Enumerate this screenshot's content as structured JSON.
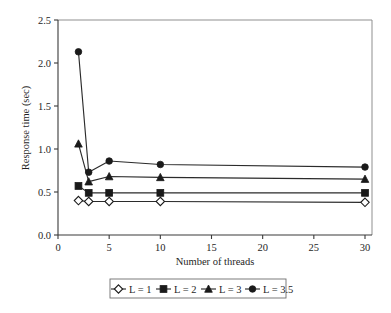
{
  "chart_data": {
    "type": "line",
    "title": "",
    "xlabel": "Number of threads",
    "ylabel": "Response time (sec)",
    "xlim": [
      0,
      30
    ],
    "ylim": [
      0,
      2.5
    ],
    "xticks": [
      "0",
      "5",
      "10",
      "15",
      "20",
      "25",
      "30"
    ],
    "yticks": [
      "0.0",
      "0.5",
      "1.0",
      "1.5",
      "2.0",
      "2.5"
    ],
    "grid": false,
    "legend_position": "below-bottom-center",
    "x": [
      2,
      3,
      5,
      10,
      30
    ],
    "series": [
      {
        "name": "L = 1",
        "marker": "diamond-open",
        "values": [
          0.4,
          0.39,
          0.39,
          0.39,
          0.38
        ]
      },
      {
        "name": "L = 2",
        "marker": "square-filled",
        "values": [
          0.57,
          0.49,
          0.49,
          0.49,
          0.49
        ]
      },
      {
        "name": "L = 3",
        "marker": "triangle-filled",
        "values": [
          1.06,
          0.62,
          0.68,
          0.67,
          0.65
        ]
      },
      {
        "name": "L = 3.5",
        "marker": "circle-filled",
        "values": [
          2.13,
          0.73,
          0.86,
          0.82,
          0.79
        ]
      }
    ],
    "colors": {
      "line": "#2b2b2b",
      "marker_fill": "#1a1a1a",
      "marker_open_fill": "#ffffff",
      "axis": "#3a3a3a",
      "frame": "#8f8f8f",
      "background": "#ffffff"
    }
  },
  "legend": {
    "items": [
      {
        "label": "L = 1"
      },
      {
        "label": "L = 2"
      },
      {
        "label": "L = 3"
      },
      {
        "label": "L = 3.5"
      }
    ]
  },
  "axes": {
    "x_title": "Number of threads",
    "y_title": "Response time (sec)",
    "x_tick_labels": [
      "0",
      "5",
      "10",
      "15",
      "20",
      "25",
      "30"
    ],
    "y_tick_labels": [
      "0.0",
      "0.5",
      "1.0",
      "1.5",
      "2.0",
      "2.5"
    ]
  }
}
